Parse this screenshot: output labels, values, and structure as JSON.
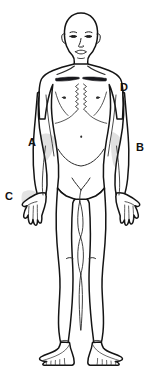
{
  "figure": {
    "view": "anterior",
    "background_color": "#ffffff",
    "outline_color": "#141414",
    "detail_color": "#2b2b2b",
    "shade_color": "#d8d8d8"
  },
  "labels": [
    {
      "id": "A",
      "text": "A",
      "x": 32,
      "y": 143,
      "target": "left-forearm-elbow-region",
      "shaded": true
    },
    {
      "id": "B",
      "text": "B",
      "x": 140,
      "y": 148,
      "target": "right-forearm-region",
      "shaded": true
    },
    {
      "id": "C",
      "text": "C",
      "x": 9,
      "y": 197,
      "target": "left-hand-region",
      "shaded": true
    },
    {
      "id": "D",
      "text": "D",
      "x": 124,
      "y": 88,
      "target": "right-shoulder-deltoid-region",
      "shaded": true
    }
  ],
  "anatomy_parts": [
    "head",
    "face",
    "eyes",
    "nose",
    "mouth",
    "ears",
    "neck",
    "clavicles",
    "chest",
    "sternum",
    "nipples",
    "abdomen",
    "navel",
    "pelvis",
    "arms",
    "elbows",
    "hands",
    "fingers",
    "thighs",
    "knees",
    "shins",
    "ankles",
    "feet",
    "toes"
  ]
}
